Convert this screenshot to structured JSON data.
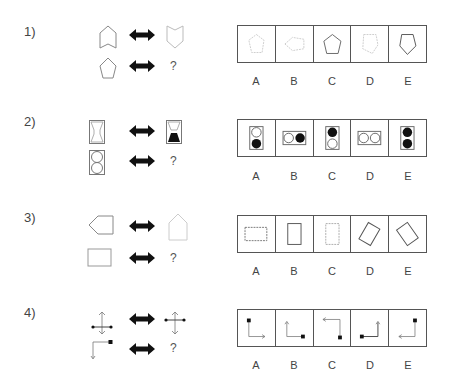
{
  "questions": [
    {
      "number": "1)",
      "relation_symbol": "double-arrow",
      "unknown": "?",
      "prompt_pairs": [
        {
          "left": "pentagon-arrow-notched-bottom",
          "right": "shield-notched-top-faint"
        },
        {
          "left": "regular-pentagon",
          "right": "?"
        }
      ],
      "options": [
        {
          "label": "A",
          "shape": "pentagon-faint-dotted"
        },
        {
          "label": "B",
          "shape": "pentagon-rotated-faint"
        },
        {
          "label": "C",
          "shape": "pentagon-upright-solid"
        },
        {
          "label": "D",
          "shape": "pentagon-inverted-faint"
        },
        {
          "label": "E",
          "shape": "pentagon-inverted-solid"
        }
      ]
    },
    {
      "number": "2)",
      "relation_symbol": "double-arrow",
      "unknown": "?",
      "prompt_pairs": [
        {
          "left": "hourglass-outline",
          "right": "hourglass-bottom-filled"
        },
        {
          "left": "two-circles-vertical-outline",
          "right": "?"
        }
      ],
      "options": [
        {
          "label": "A",
          "shape": "circles-vertical-bottom-filled"
        },
        {
          "label": "B",
          "shape": "circles-horizontal-right-filled"
        },
        {
          "label": "C",
          "shape": "circles-vertical-top-filled"
        },
        {
          "label": "D",
          "shape": "circles-horizontal-outline"
        },
        {
          "label": "E",
          "shape": "circles-vertical-both-filled"
        }
      ]
    },
    {
      "number": "3)",
      "relation_symbol": "double-arrow",
      "unknown": "?",
      "prompt_pairs": [
        {
          "left": "pentagon-pointing-left",
          "right": "house-pointing-up-faint"
        },
        {
          "left": "rectangle-horizontal",
          "right": "?"
        }
      ],
      "options": [
        {
          "label": "A",
          "shape": "rectangle-horizontal-dashed"
        },
        {
          "label": "B",
          "shape": "rectangle-vertical-solid"
        },
        {
          "label": "C",
          "shape": "rectangle-vertical-dashed"
        },
        {
          "label": "D",
          "shape": "rectangle-tilted-right"
        },
        {
          "label": "E",
          "shape": "rectangle-tilted-left"
        }
      ]
    },
    {
      "number": "4)",
      "relation_symbol": "double-arrow",
      "unknown": "?",
      "prompt_pairs": [
        {
          "left": "cross-dots-horizontal-arrows-vertical",
          "right": "cross-dots-horizontal-arrows-vertical-rotated"
        },
        {
          "left": "corner-square-arrow-down",
          "right": "?"
        }
      ],
      "options": [
        {
          "label": "A",
          "shape": "corner-square-top-arrow-right"
        },
        {
          "label": "B",
          "shape": "corner-square-right-arrow-up"
        },
        {
          "label": "C",
          "shape": "corner-square-bottom-arrow-left"
        },
        {
          "label": "D",
          "shape": "corner-square-left-arrow-up"
        },
        {
          "label": "E",
          "shape": "corner-square-top-arrow-left"
        }
      ]
    }
  ]
}
